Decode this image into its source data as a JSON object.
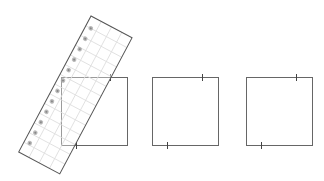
{
  "figure": {
    "colors": {
      "background": "#ffffff",
      "square_stroke": "#666666",
      "ruler_stroke": "#555555",
      "ruler_grid": "#dddddd",
      "dot_fill": "#aaaaaa"
    },
    "squares": [
      {
        "id": "square-1",
        "x": 61,
        "y": 77,
        "w": 66,
        "h": 68,
        "top_tick_x": 110,
        "bottom_tick_x": 76
      },
      {
        "id": "square-2",
        "x": 152,
        "y": 77,
        "w": 66,
        "h": 68,
        "top_tick_x": 202,
        "bottom_tick_x": 167
      },
      {
        "id": "square-3",
        "x": 246,
        "y": 77,
        "w": 66,
        "h": 68,
        "top_tick_x": 296,
        "bottom_tick_x": 261
      }
    ],
    "ruler": {
      "origin": [
        91,
        16
      ],
      "rotation_deg": 28,
      "width": 46.5,
      "length": 154,
      "grid_columns": 4,
      "grid_rows": 14,
      "dot_count": 12
    }
  }
}
